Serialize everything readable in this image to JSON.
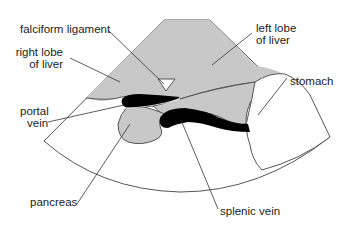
{
  "colors": {
    "background": "#ffffff",
    "liver": "#c8c8c8",
    "pancreas": "#c8c8c8",
    "vessel": "#000000",
    "outline": "#555555",
    "text": "#222222"
  },
  "labels": {
    "falciform_ligament": "falciform ligament",
    "right_lobe_line1": "right lobe",
    "right_lobe_line2": "of liver",
    "left_lobe_line1": "left lobe",
    "left_lobe_line2": "of liver",
    "stomach": "stomach",
    "portal_line1": "portal",
    "portal_line2": "vein",
    "pancreas": "pancreas",
    "splenic_vein": "splenic vein"
  }
}
